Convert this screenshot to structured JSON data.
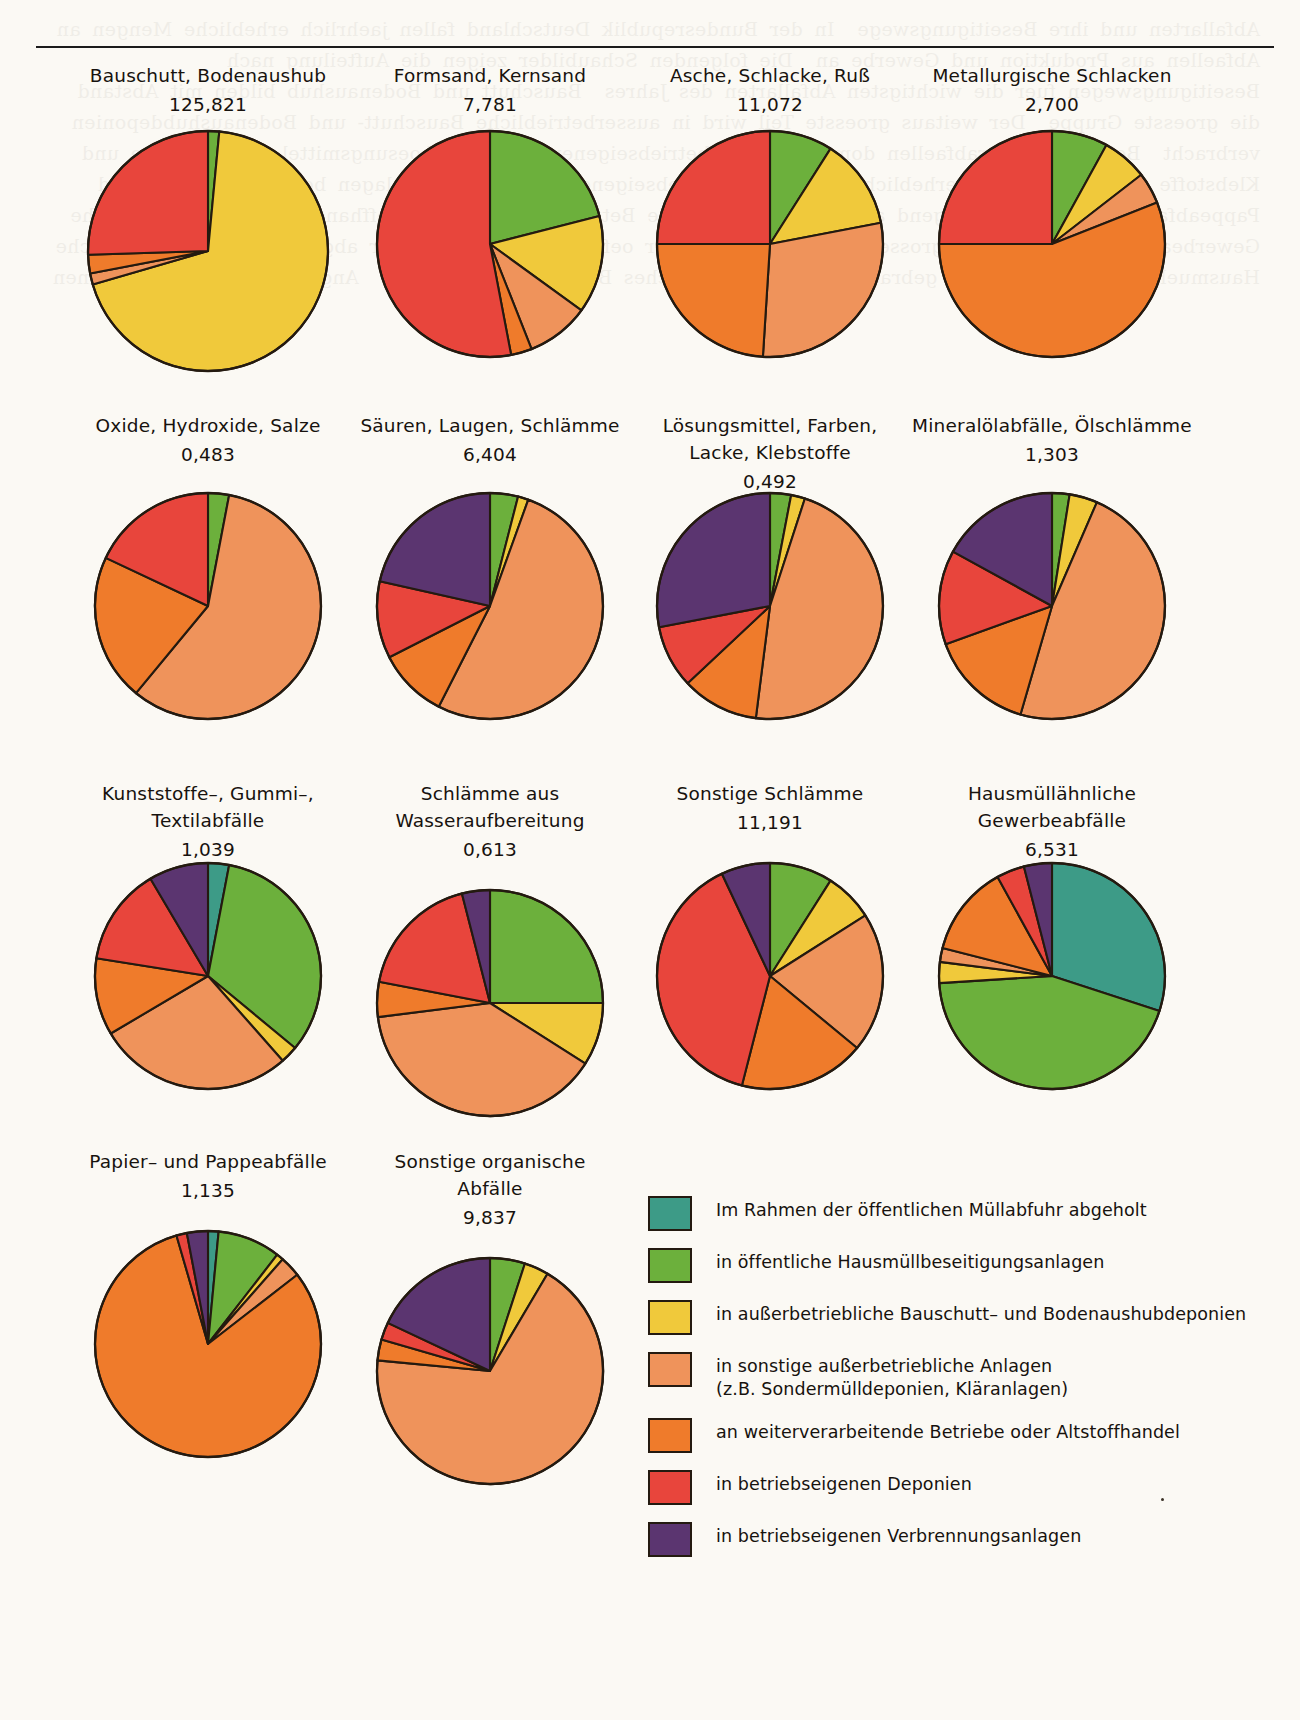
{
  "page": {
    "background_color": "#fbf9f4",
    "ghost_text": "Abfallarten und ihre Beseitigungswege  In der Bundesrepublik Deutschland fallen jaehrlich erhebliche Mengen an Abfaellen aus Produktion und Gewerbe an  Die folgenden Schaubilder zeigen die Aufteilung nach Beseitigungswegen fuer die wichtigsten Abfallarten des Jahres  Bauschutt und Bodenaushub bilden mit Abstand die groesste Gruppe  Der weitaus groesste Teil wird in ausserbetriebliche Bauschutt- und Bodenaushubdeponien verbracht  Bei den Sonderabfaellen dominieren die betriebseigenen Anlagen  Loesungsmittel Farben Lacke und Klebstoffe werden zu einem erheblichen Anteil in betriebseigenen Verbrennungsanlagen beseitigt  Papier- und Pappeabfaelle gehen ueberwiegend an weiterverarbeitende Betriebe oder den Altstoffhandel  Hausmuellaehnliche Gewerbeabfaelle werden zum grossen Teil im Rahmen der oeffentlichen Muellabfuhr abgeholt oder in oeffentliche Hausmuellbeseitigungsanlagen gebracht  Quelle Statistisches Bundesamt Wiesbaden  Angaben in Millionen Tonnen"
  },
  "legend": {
    "items": [
      {
        "id": "oeffentliche-muellabfuhr",
        "color": "#3d9b87",
        "label": "Im Rahmen der öffentlichen Müllabfuhr abgeholt"
      },
      {
        "id": "oeffentliche-hausmuellanlagen",
        "color": "#6cb03c",
        "label": "in öffentliche Hausmüllbeseitigungsanlagen"
      },
      {
        "id": "ausserbetriebliche-deponien",
        "color": "#f0c93b",
        "label": "in außerbetriebliche Bauschutt– und Bodenaushubdeponien"
      },
      {
        "id": "sonstige-ausserbetriebliche",
        "color": "#ef935b",
        "label": "in sonstige außerbetriebliche Anlagen\n(z.B. Sondermülldeponien, Kläranlagen)"
      },
      {
        "id": "weiterverarbeitende-betriebe",
        "color": "#ef7b2b",
        "label": "an weiterverarbeitende Betriebe oder Altstoffhandel"
      },
      {
        "id": "betriebseigene-deponien",
        "color": "#e8453c",
        "label": "in betriebseigenen Deponien"
      },
      {
        "id": "betriebseigene-verbrennung",
        "color": "#5b3570",
        "label": "in betriebseigenen Verbrennungsanlagen"
      }
    ]
  },
  "chart_data": [
    {
      "type": "pie",
      "id": "bauschutt-bodenaushub",
      "title": "Bauschutt, Bodenaushub",
      "value_label": "125,821",
      "row": 1,
      "col": 1,
      "radius": 120,
      "categories": [
        "Im Rahmen der öffentlichen Müllabfuhr abgeholt",
        "in öffentliche Hausmüllbeseitigungsanlagen",
        "in außerbetriebliche Bauschutt– und Bodenaushubdeponien",
        "in sonstige außerbetriebliche Anlagen (z.B. Sondermülldeponien, Kläranlagen)",
        "an weiterverarbeitende Betriebe oder Altstoffhandel",
        "in betriebseigenen Deponien",
        "in betriebseigenen Verbrennungsanlagen"
      ],
      "values": [
        0,
        1.5,
        69,
        1.5,
        2.5,
        25.5,
        0
      ],
      "colors": [
        "#3d9b87",
        "#6cb03c",
        "#f0c93b",
        "#ef935b",
        "#ef7b2b",
        "#e8453c",
        "#5b3570"
      ]
    },
    {
      "type": "pie",
      "id": "formsand-kernsand",
      "title": "Formsand, Kernsand",
      "value_label": "7,781",
      "row": 1,
      "col": 2,
      "radius": 113,
      "categories": [
        "Im Rahmen der öffentlichen Müllabfuhr abgeholt",
        "in öffentliche Hausmüllbeseitigungsanlagen",
        "in außerbetriebliche Bauschutt– und Bodenaushubdeponien",
        "in sonstige außerbetriebliche Anlagen (z.B. Sondermülldeponien, Kläranlagen)",
        "an weiterverarbeitende Betriebe oder Altstoffhandel",
        "in betriebseigenen Deponien",
        "in betriebseigenen Verbrennungsanlagen"
      ],
      "values": [
        0,
        21,
        14,
        9,
        3,
        53,
        0
      ],
      "colors": [
        "#3d9b87",
        "#6cb03c",
        "#f0c93b",
        "#ef935b",
        "#ef7b2b",
        "#e8453c",
        "#5b3570"
      ]
    },
    {
      "type": "pie",
      "id": "asche-schlacke-russ",
      "title": "Asche, Schlacke, Ruß",
      "value_label": "11,072",
      "row": 1,
      "col": 3,
      "radius": 113,
      "categories": [
        "Im Rahmen der öffentlichen Müllabfuhr abgeholt",
        "in öffentliche Hausmüllbeseitigungsanlagen",
        "in außerbetriebliche Bauschutt– und Bodenaushubdeponien",
        "in sonstige außerbetriebliche Anlagen (z.B. Sondermülldeponien, Kläranlagen)",
        "an weiterverarbeitende Betriebe oder Altstoffhandel",
        "in betriebseigenen Deponien",
        "in betriebseigenen Verbrennungsanlagen"
      ],
      "values": [
        0,
        9,
        13,
        29,
        24,
        25,
        0
      ],
      "colors": [
        "#3d9b87",
        "#6cb03c",
        "#f0c93b",
        "#ef935b",
        "#ef7b2b",
        "#e8453c",
        "#5b3570"
      ]
    },
    {
      "type": "pie",
      "id": "metallurgische-schlacken",
      "title": "Metallurgische Schlacken",
      "value_label": "2,700",
      "row": 1,
      "col": 4,
      "radius": 113,
      "categories": [
        "Im Rahmen der öffentlichen Müllabfuhr abgeholt",
        "in öffentliche Hausmüllbeseitigungsanlagen",
        "in außerbetriebliche Bauschutt– und Bodenaushubdeponien",
        "in sonstige außerbetriebliche Anlagen (z.B. Sondermülldeponien, Kläranlagen)",
        "an weiterverarbeitende Betriebe oder Altstoffhandel",
        "in betriebseigenen Deponien",
        "in betriebseigenen Verbrennungsanlagen"
      ],
      "values": [
        0,
        8,
        6.5,
        4.5,
        56,
        25,
        0
      ],
      "colors": [
        "#3d9b87",
        "#6cb03c",
        "#f0c93b",
        "#ef935b",
        "#ef7b2b",
        "#e8453c",
        "#5b3570"
      ]
    },
    {
      "type": "pie",
      "id": "oxide-hydroxide-salze",
      "title": "Oxide, Hydroxide, Salze",
      "value_label": "0,483",
      "row": 2,
      "col": 1,
      "radius": 113,
      "categories": [
        "Im Rahmen der öffentlichen Müllabfuhr abgeholt",
        "in öffentliche Hausmüllbeseitigungsanlagen",
        "in außerbetriebliche Bauschutt– und Bodenaushubdeponien",
        "in sonstige außerbetriebliche Anlagen (z.B. Sondermülldeponien, Kläranlagen)",
        "an weiterverarbeitende Betriebe oder Altstoffhandel",
        "in betriebseigenen Deponien",
        "in betriebseigenen Verbrennungsanlagen"
      ],
      "values": [
        0,
        3,
        0,
        58,
        21,
        18,
        0
      ],
      "colors": [
        "#3d9b87",
        "#6cb03c",
        "#f0c93b",
        "#ef935b",
        "#ef7b2b",
        "#e8453c",
        "#5b3570"
      ]
    },
    {
      "type": "pie",
      "id": "saeuren-laugen-schlaemme",
      "title": "Säuren, Laugen, Schlämme",
      "value_label": "6,404",
      "row": 2,
      "col": 2,
      "radius": 113,
      "categories": [
        "Im Rahmen der öffentlichen Müllabfuhr abgeholt",
        "in öffentliche Hausmüllbeseitigungsanlagen",
        "in außerbetriebliche Bauschutt– und Bodenaushubdeponien",
        "in sonstige außerbetriebliche Anlagen (z.B. Sondermülldeponien, Kläranlagen)",
        "an weiterverarbeitende Betriebe oder Altstoffhandel",
        "in betriebseigenen Deponien",
        "in betriebseigenen Verbrennungsanlagen"
      ],
      "values": [
        0,
        4,
        1.5,
        52,
        10,
        11,
        21.5
      ],
      "colors": [
        "#3d9b87",
        "#6cb03c",
        "#f0c93b",
        "#ef935b",
        "#ef7b2b",
        "#e8453c",
        "#5b3570"
      ]
    },
    {
      "type": "pie",
      "id": "loesungsmittel-farben-lacke-klebstoffe",
      "title": "Lösungsmittel, Farben,\nLacke, Klebstoffe",
      "value_label": "0,492",
      "row": 2,
      "col": 3,
      "radius": 113,
      "categories": [
        "Im Rahmen der öffentlichen Müllabfuhr abgeholt",
        "in öffentliche Hausmüllbeseitigungsanlagen",
        "in außerbetriebliche Bauschutt– und Bodenaushubdeponien",
        "in sonstige außerbetriebliche Anlagen (z.B. Sondermülldeponien, Kläranlagen)",
        "an weiterverarbeitende Betriebe oder Altstoffhandel",
        "in betriebseigenen Deponien",
        "in betriebseigenen Verbrennungsanlagen"
      ],
      "values": [
        0,
        3,
        2,
        47,
        11,
        9,
        28
      ],
      "colors": [
        "#3d9b87",
        "#6cb03c",
        "#f0c93b",
        "#ef935b",
        "#ef7b2b",
        "#e8453c",
        "#5b3570"
      ]
    },
    {
      "type": "pie",
      "id": "mineraloelabfaelle-oelschlaemme",
      "title": "Mineralölabfälle, Ölschlämme",
      "value_label": "1,303",
      "row": 2,
      "col": 4,
      "radius": 113,
      "categories": [
        "Im Rahmen der öffentlichen Müllabfuhr abgeholt",
        "in öffentliche Hausmüllbeseitigungsanlagen",
        "in außerbetriebliche Bauschutt– und Bodenaushubdeponien",
        "in sonstige außerbetriebliche Anlagen (z.B. Sondermülldeponien, Kläranlagen)",
        "an weiterverarbeitende Betriebe oder Altstoffhandel",
        "in betriebseigenen Deponien",
        "in betriebseigenen Verbrennungsanlagen"
      ],
      "values": [
        0,
        2.5,
        4,
        48,
        15,
        13.5,
        17
      ],
      "colors": [
        "#3d9b87",
        "#6cb03c",
        "#f0c93b",
        "#ef935b",
        "#ef7b2b",
        "#e8453c",
        "#5b3570"
      ]
    },
    {
      "type": "pie",
      "id": "kunststoffe-gummi-textilabfaelle",
      "title": "Kunststoffe–, Gummi–,\nTextilabfälle",
      "value_label": "1,039",
      "row": 3,
      "col": 1,
      "radius": 113,
      "categories": [
        "Im Rahmen der öffentlichen Müllabfuhr abgeholt",
        "in öffentliche Hausmüllbeseitigungsanlagen",
        "in außerbetriebliche Bauschutt– und Bodenaushubdeponien",
        "in sonstige außerbetriebliche Anlagen (z.B. Sondermülldeponien, Kläranlagen)",
        "an weiterverarbeitende Betriebe oder Altstoffhandel",
        "in betriebseigenen Deponien",
        "in betriebseigenen Verbrennungsanlagen"
      ],
      "values": [
        3,
        33,
        2.5,
        28,
        11,
        14,
        8.5
      ],
      "colors": [
        "#3d9b87",
        "#6cb03c",
        "#f0c93b",
        "#ef935b",
        "#ef7b2b",
        "#e8453c",
        "#5b3570"
      ]
    },
    {
      "type": "pie",
      "id": "schlaemme-aus-wasseraufbereitung",
      "title": "Schlämme aus Wasseraufbereitung",
      "value_label": "0,613",
      "row": 3,
      "col": 2,
      "radius": 113,
      "categories": [
        "Im Rahmen der öffentlichen Müllabfuhr abgeholt",
        "in öffentliche Hausmüllbeseitigungsanlagen",
        "in außerbetriebliche Bauschutt– und Bodenaushubdeponien",
        "in sonstige außerbetriebliche Anlagen (z.B. Sondermülldeponien, Kläranlagen)",
        "an weiterverarbeitende Betriebe oder Altstoffhandel",
        "in betriebseigenen Deponien",
        "in betriebseigenen Verbrennungsanlagen"
      ],
      "values": [
        0,
        25,
        9,
        39,
        5,
        18,
        4
      ],
      "colors": [
        "#3d9b87",
        "#6cb03c",
        "#f0c93b",
        "#ef935b",
        "#ef7b2b",
        "#e8453c",
        "#5b3570"
      ]
    },
    {
      "type": "pie",
      "id": "sonstige-schlaemme",
      "title": "Sonstige Schlämme",
      "value_label": "11,191",
      "row": 3,
      "col": 3,
      "radius": 113,
      "categories": [
        "Im Rahmen der öffentlichen Müllabfuhr abgeholt",
        "in öffentliche Hausmüllbeseitigungsanlagen",
        "in außerbetriebliche Bauschutt– und Bodenaushubdeponien",
        "in sonstige außerbetriebliche Anlagen (z.B. Sondermülldeponien, Kläranlagen)",
        "an weiterverarbeitende Betriebe oder Altstoffhandel",
        "in betriebseigenen Deponien",
        "in betriebseigenen Verbrennungsanlagen"
      ],
      "values": [
        0,
        9,
        7,
        20,
        18,
        39,
        7
      ],
      "colors": [
        "#3d9b87",
        "#6cb03c",
        "#f0c93b",
        "#ef935b",
        "#ef7b2b",
        "#e8453c",
        "#5b3570"
      ]
    },
    {
      "type": "pie",
      "id": "hausmuellaehnliche-gewerbeabfaelle",
      "title": "Hausmüllähnliche\nGewerbeabfälle",
      "value_label": "6,531",
      "row": 3,
      "col": 4,
      "radius": 113,
      "categories": [
        "Im Rahmen der öffentlichen Müllabfuhr abgeholt",
        "in öffentliche Hausmüllbeseitigungsanlagen",
        "in außerbetriebliche Bauschutt– und Bodenaushubdeponien",
        "in sonstige außerbetriebliche Anlagen (z.B. Sondermülldeponien, Kläranlagen)",
        "an weiterverarbeitende Betriebe oder Altstoffhandel",
        "in betriebseigenen Deponien",
        "in betriebseigenen Verbrennungsanlagen"
      ],
      "values": [
        30,
        44,
        3,
        2,
        13,
        4,
        4
      ],
      "colors": [
        "#3d9b87",
        "#6cb03c",
        "#f0c93b",
        "#ef935b",
        "#ef7b2b",
        "#e8453c",
        "#5b3570"
      ]
    },
    {
      "type": "pie",
      "id": "papier-pappeabfaelle",
      "title": "Papier– und Pappeabfälle",
      "value_label": "1,135",
      "row": 4,
      "col": 1,
      "radius": 113,
      "categories": [
        "Im Rahmen der öffentlichen Müllabfuhr abgeholt",
        "in öffentliche Hausmüllbeseitigungsanlagen",
        "in außerbetriebliche Bauschutt– und Bodenaushubdeponien",
        "in sonstige außerbetriebliche Anlagen (z.B. Sondermülldeponien, Kläranlagen)",
        "an weiterverarbeitende Betriebe oder Altstoffhandel",
        "in betriebseigenen Deponien",
        "in betriebseigenen Verbrennungsanlagen"
      ],
      "values": [
        1.5,
        9,
        1,
        3,
        81,
        1.5,
        3
      ],
      "colors": [
        "#3d9b87",
        "#6cb03c",
        "#f0c93b",
        "#ef935b",
        "#ef7b2b",
        "#e8453c",
        "#5b3570"
      ]
    },
    {
      "type": "pie",
      "id": "sonstige-organische-abfaelle",
      "title": "Sonstige organische Abfälle",
      "value_label": "9,837",
      "row": 4,
      "col": 2,
      "radius": 113,
      "categories": [
        "Im Rahmen der öffentlichen Müllabfuhr abgeholt",
        "in öffentliche Hausmüllbeseitigungsanlagen",
        "in außerbetriebliche Bauschutt– und Bodenaushubdeponien",
        "in sonstige außerbetriebliche Anlagen (z.B. Sondermülldeponien, Kläranlagen)",
        "an weiterverarbeitende Betriebe oder Altstoffhandel",
        "in betriebseigenen Deponien",
        "in betriebseigenen Verbrennungsanlagen"
      ],
      "values": [
        0,
        5,
        3.5,
        68,
        3,
        2.5,
        18
      ],
      "colors": [
        "#3d9b87",
        "#6cb03c",
        "#f0c93b",
        "#ef935b",
        "#ef7b2b",
        "#e8453c",
        "#5b3570"
      ]
    }
  ]
}
